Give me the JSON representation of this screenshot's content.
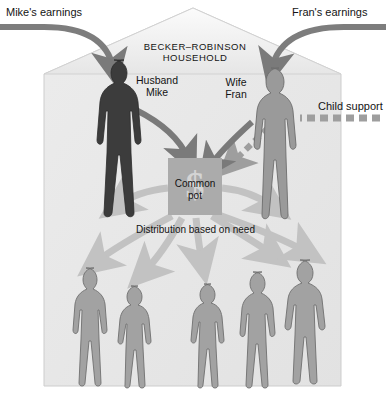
{
  "figure": {
    "type": "diagram",
    "background_color": "#ffffff",
    "house_fill": "#e9e9e9",
    "house_roof_fill": "#efefef",
    "house_stroke": "#c9c9c9"
  },
  "house": {
    "title_line1": "BECKER–ROBINSON",
    "title_line2": "HOUSEHOLD"
  },
  "external_labels": {
    "mike_earnings": "Mike's earnings",
    "fran_earnings": "Fran's earnings",
    "child_support": "Child support"
  },
  "people": {
    "husband": {
      "role_label": "Husband",
      "name_label": "Mike",
      "color": "#3c3c3c"
    },
    "wife": {
      "role_label": "Wife",
      "name_label": "Fran",
      "color": "#9a9a9a"
    },
    "children": {
      "count": 5,
      "color": "#a2a2a2",
      "stroke": "#6f6f6f"
    }
  },
  "common_pot": {
    "line1": "Common",
    "line2": "pot",
    "currency_symbol": "$",
    "box_color": "#ababab"
  },
  "distribution": {
    "caption": "Distribution based on need",
    "arrow_color": "#c2c2c2"
  },
  "arrows": {
    "income_arrow_color": "#7d7d7d",
    "pot_arrow_color": "#7a7a7a",
    "child_support_color": "#9e9e9e",
    "child_support_style": "dashed"
  }
}
